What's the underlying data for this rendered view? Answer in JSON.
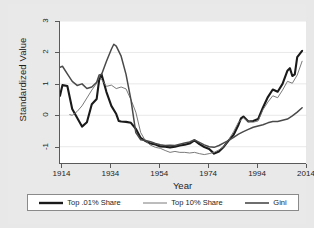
{
  "chart_data": {
    "type": "line",
    "title": "",
    "xlabel": "Year",
    "ylabel": "Standardized Value",
    "xlim": [
      1913,
      2014
    ],
    "ylim": [
      -1.55,
      3.0
    ],
    "xticks": [
      1914,
      1934,
      1954,
      1974,
      1994,
      2014
    ],
    "xtick_labels": [
      "1914",
      "1934",
      "1954",
      "1974",
      "1994",
      "2014"
    ],
    "yticks": [
      -1,
      0,
      1,
      2,
      3
    ],
    "ytick_labels": [
      "-1",
      "0",
      "1",
      "2",
      "3"
    ],
    "grid": "horizontal",
    "legend_position": "below",
    "series": [
      {
        "name": "Top .01% Share",
        "color": "#1a1a1a",
        "width": 2.1,
        "x": [
          1913,
          1914,
          1916,
          1918,
          1920,
          1922,
          1924,
          1926,
          1928,
          1929,
          1930,
          1932,
          1934,
          1936,
          1937,
          1938,
          1940,
          1942,
          1944,
          1946,
          1948,
          1950,
          1952,
          1954,
          1956,
          1958,
          1960,
          1962,
          1964,
          1966,
          1968,
          1970,
          1972,
          1974,
          1976,
          1978,
          1980,
          1982,
          1984,
          1986,
          1987,
          1988,
          1990,
          1992,
          1994,
          1996,
          1998,
          2000,
          2002,
          2004,
          2006,
          2007,
          2008,
          2009,
          2010,
          2012
        ],
        "y": [
          0.62,
          0.96,
          0.93,
          0.2,
          -0.08,
          -0.36,
          -0.22,
          0.35,
          0.52,
          1.12,
          1.3,
          0.74,
          0.3,
          0.04,
          -0.18,
          -0.2,
          -0.21,
          -0.24,
          -0.43,
          -0.72,
          -0.82,
          -0.9,
          -0.93,
          -0.99,
          -1.0,
          -1.02,
          -1.0,
          -0.96,
          -0.94,
          -0.9,
          -0.8,
          -0.92,
          -1.01,
          -1.07,
          -1.22,
          -1.15,
          -1.0,
          -0.8,
          -0.62,
          -0.3,
          -0.1,
          -0.04,
          -0.2,
          -0.18,
          -0.12,
          0.25,
          0.58,
          0.82,
          0.75,
          1.0,
          1.42,
          1.5,
          1.25,
          1.3,
          1.85,
          2.05
        ]
      },
      {
        "name": "Top 10% Share",
        "color": "#6b6b6b",
        "width": 0.9,
        "x": [
          1917,
          1918,
          1920,
          1922,
          1924,
          1926,
          1928,
          1929,
          1930,
          1932,
          1934,
          1936,
          1938,
          1940,
          1942,
          1944,
          1946,
          1948,
          1950,
          1952,
          1954,
          1956,
          1958,
          1960,
          1962,
          1964,
          1966,
          1968,
          1970,
          1972,
          1974,
          1976,
          1978,
          1980,
          1982,
          1984,
          1986,
          1988,
          1990,
          1992,
          1994,
          1996,
          1998,
          2000,
          2002,
          2004,
          2006,
          2008,
          2010,
          2012
        ],
        "y": [
          0.02,
          0.0,
          0.12,
          0.3,
          0.55,
          0.8,
          1.02,
          1.24,
          1.14,
          0.92,
          0.96,
          0.85,
          0.9,
          0.84,
          0.5,
          0.1,
          -0.55,
          -0.82,
          -0.95,
          -1.02,
          -1.05,
          -1.12,
          -1.18,
          -1.15,
          -1.18,
          -1.18,
          -1.2,
          -1.18,
          -1.22,
          -1.25,
          -1.22,
          -1.18,
          -1.1,
          -1.0,
          -0.78,
          -0.52,
          -0.22,
          -0.08,
          -0.2,
          -0.22,
          -0.18,
          0.18,
          0.42,
          0.62,
          0.56,
          0.8,
          1.08,
          1.02,
          1.28,
          1.72
        ]
      },
      {
        "name": "Gini",
        "color": "#4a4a4a",
        "width": 1.5,
        "x": [
          1913,
          1914,
          1916,
          1918,
          1920,
          1922,
          1924,
          1926,
          1928,
          1929,
          1930,
          1932,
          1934,
          1935,
          1936,
          1938,
          1940,
          1942,
          1944,
          1946,
          1948,
          1950,
          1952,
          1954,
          1956,
          1958,
          1960,
          1962,
          1964,
          1966,
          1968,
          1970,
          1972,
          1974,
          1976,
          1978,
          1980,
          1982,
          1984,
          1986,
          1988,
          1990,
          1992,
          1994,
          1996,
          1998,
          2000,
          2002,
          2004,
          2006,
          2008,
          2010,
          2012
        ],
        "y": [
          1.53,
          1.56,
          1.32,
          1.08,
          0.95,
          1.0,
          0.85,
          0.9,
          1.05,
          1.28,
          1.3,
          1.72,
          2.1,
          2.26,
          2.2,
          1.88,
          1.3,
          0.5,
          -0.55,
          -0.78,
          -0.8,
          -0.84,
          -0.9,
          -0.94,
          -0.96,
          -0.95,
          -0.96,
          -0.92,
          -0.88,
          -0.85,
          -0.78,
          -0.86,
          -0.94,
          -1.0,
          -1.02,
          -0.96,
          -0.88,
          -0.8,
          -0.7,
          -0.6,
          -0.52,
          -0.45,
          -0.38,
          -0.34,
          -0.3,
          -0.24,
          -0.2,
          -0.2,
          -0.16,
          -0.12,
          -0.02,
          0.1,
          0.24
        ]
      }
    ]
  },
  "axis": {
    "y_title": "Standardized Value",
    "x_title": "Year"
  },
  "legend": {
    "items": [
      {
        "label": "Top .01% Share"
      },
      {
        "label": "Top 10% Share"
      },
      {
        "label": "Gini"
      }
    ]
  }
}
